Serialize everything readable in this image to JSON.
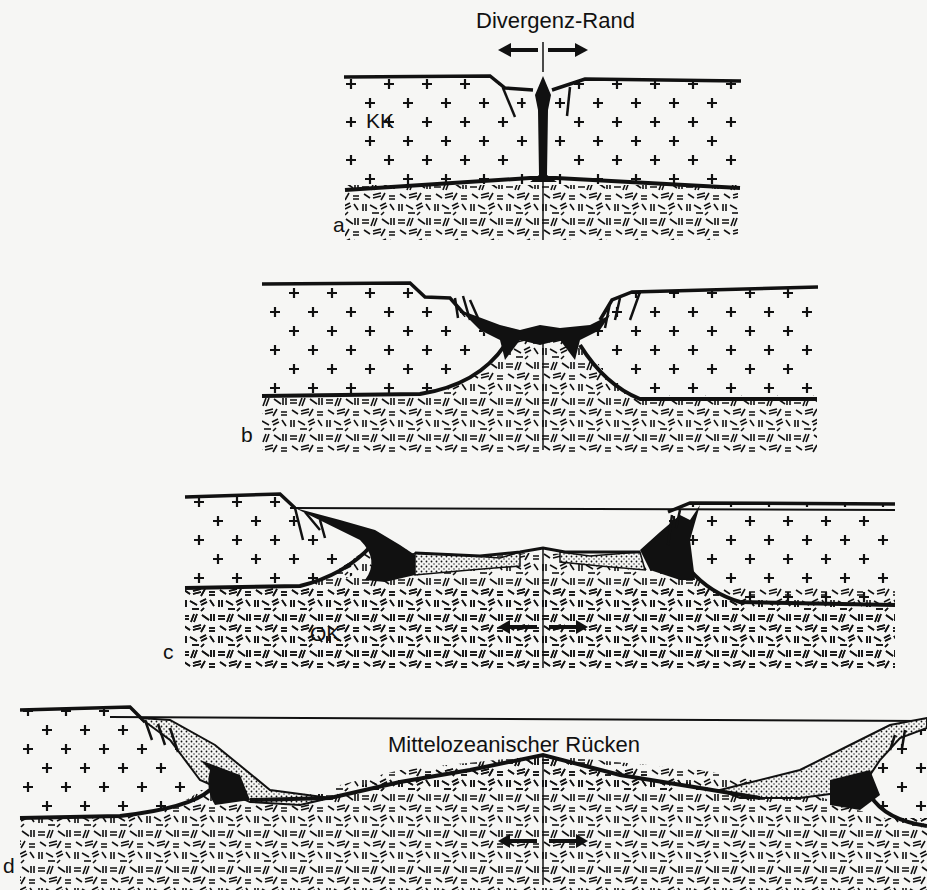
{
  "figure": {
    "labels": {
      "divergent_margin": "Divergenz-Rand",
      "mid_ocean_ridge": "Mittelozeanischer Rücken",
      "continental_crust": "KK",
      "oceanic_crust": "OK"
    },
    "panels": [
      {
        "letter": "a",
        "stage": "rift initiation"
      },
      {
        "letter": "b",
        "stage": "rift widening"
      },
      {
        "letter": "c",
        "stage": "narrow ocean basin"
      },
      {
        "letter": "d",
        "stage": "mature ocean with mid-ocean ridge"
      }
    ],
    "colors": {
      "paper": "#f6f6f4",
      "ink": "#111111"
    }
  }
}
